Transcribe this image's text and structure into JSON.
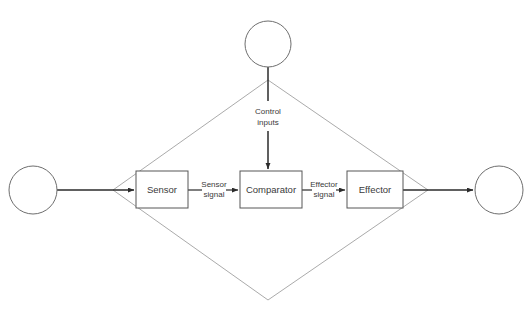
{
  "diagram": {
    "type": "control-system-block-diagram",
    "background_color": "#ffffff",
    "line_color_flow": "#2b2b2b",
    "line_color_boundary": "#a0a0a0",
    "box_stroke_color": "#565656",
    "text_color": "#3a3a3a",
    "boxes": [
      {
        "id": "sensor",
        "label": "Sensor",
        "x": 136,
        "y": 171,
        "w": 52,
        "h": 37
      },
      {
        "id": "comparator",
        "label": "Comparator",
        "x": 240,
        "y": 171,
        "w": 62,
        "h": 37
      },
      {
        "id": "effector",
        "label": "Effector",
        "x": 347,
        "y": 171,
        "w": 56,
        "h": 37
      }
    ],
    "circles": [
      {
        "id": "input-source",
        "cx": 33,
        "cy": 190,
        "r": 24,
        "label": ""
      },
      {
        "id": "control-input-source",
        "cx": 268,
        "cy": 44,
        "r": 23,
        "label": ""
      },
      {
        "id": "output-sink",
        "cx": 499,
        "cy": 190,
        "r": 24,
        "label": ""
      }
    ],
    "edge_labels": [
      {
        "id": "sensor-signal",
        "line1": "Sensor",
        "line2": "signal",
        "x": 214,
        "y": 190
      },
      {
        "id": "effector-signal",
        "line1": "Effector",
        "line2": "signal",
        "x": 324,
        "y": 190
      },
      {
        "id": "control-inputs",
        "line1": "Control",
        "line2": "inputs",
        "x": 268,
        "y": 117
      }
    ],
    "boundary": {
      "id": "system-boundary",
      "left_vertex": {
        "x": 113,
        "y": 190
      },
      "top_vertex": {
        "x": 268,
        "y": 80
      },
      "right_vertex": {
        "x": 428,
        "y": 190
      },
      "bottom_vertex": {
        "x": 268,
        "y": 300
      }
    }
  }
}
